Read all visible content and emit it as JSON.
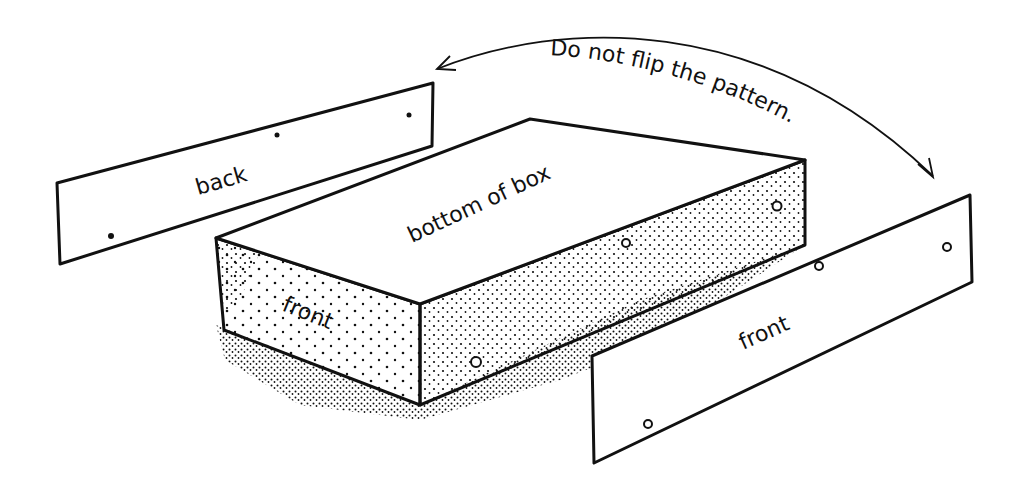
{
  "diagram": {
    "callout": "Do not flip the pattern.",
    "labels": {
      "back_strip": "back",
      "box_top": "bottom of box",
      "box_front": "front",
      "front_strip": "front"
    },
    "colors": {
      "ink": "#111111",
      "background": "#ffffff"
    }
  }
}
